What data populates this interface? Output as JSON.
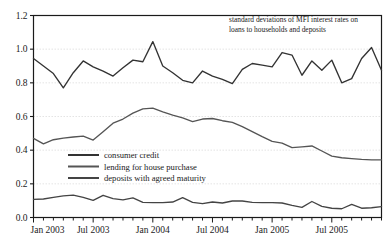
{
  "chart_data": {
    "type": "line",
    "title": "",
    "annotation_lines": [
      "standard deviations of MFI interest rates on",
      "loans to households and deposits"
    ],
    "xlabel": "",
    "ylabel": "",
    "ylim": [
      0.0,
      1.2
    ],
    "ytick_labels": [
      "0.0",
      "0.2",
      "0.4",
      "0.6",
      "0.8",
      "1.0",
      "1.2"
    ],
    "ytick_values": [
      0.0,
      0.2,
      0.4,
      0.6,
      0.8,
      1.0,
      1.2
    ],
    "xtick_labels": [
      "Jan 2003",
      "Jul 2003",
      "Jan 2004",
      "Jul 2004",
      "Jan 2005",
      "Jul 2005"
    ],
    "xtick_indices": [
      0,
      6,
      12,
      18,
      24,
      30
    ],
    "x_months": [
      "Jan 2003",
      "Feb 2003",
      "Mar 2003",
      "Apr 2003",
      "May 2003",
      "Jun 2003",
      "Jul 2003",
      "Aug 2003",
      "Sep 2003",
      "Oct 2003",
      "Nov 2003",
      "Dec 2003",
      "Jan 2004",
      "Feb 2004",
      "Mar 2004",
      "Apr 2004",
      "May 2004",
      "Jun 2004",
      "Jul 2004",
      "Aug 2004",
      "Sep 2004",
      "Oct 2004",
      "Nov 2004",
      "Dec 2004",
      "Jan 2005",
      "Feb 2005",
      "Mar 2005",
      "Apr 2005",
      "May 2005",
      "Jun 2005",
      "Jul 2005",
      "Aug 2005",
      "Sep 2005",
      "Oct 2005",
      "Nov 2005",
      "Dec 2005"
    ],
    "grid": true,
    "grid_axis": "y",
    "legend_position": "inside-left",
    "series": [
      {
        "name": "consumer credit",
        "color": "#333333",
        "values": [
          0.945,
          0.9,
          0.855,
          0.77,
          0.86,
          0.93,
          0.895,
          0.87,
          0.84,
          0.89,
          0.935,
          0.925,
          1.045,
          0.9,
          0.86,
          0.815,
          0.8,
          0.87,
          0.84,
          0.82,
          0.795,
          0.88,
          0.915,
          0.905,
          0.895,
          0.98,
          0.965,
          0.845,
          0.93,
          0.875,
          0.935,
          0.8,
          0.825,
          0.945,
          1.01,
          0.875
        ]
      },
      {
        "name": "lending for house purchase",
        "color": "#555555",
        "values": [
          0.47,
          0.437,
          0.462,
          0.472,
          0.478,
          0.483,
          0.46,
          0.51,
          0.56,
          0.585,
          0.62,
          0.645,
          0.65,
          0.628,
          0.608,
          0.592,
          0.57,
          0.585,
          0.588,
          0.575,
          0.565,
          0.54,
          0.51,
          0.48,
          0.452,
          0.442,
          0.415,
          0.42,
          0.425,
          0.395,
          0.365,
          0.355,
          0.35,
          0.345,
          0.342,
          0.342
        ]
      },
      {
        "name": "deposits with agreed maturity",
        "color": "#444444",
        "values": [
          0.108,
          0.11,
          0.12,
          0.128,
          0.133,
          0.12,
          0.102,
          0.132,
          0.112,
          0.105,
          0.117,
          0.09,
          0.088,
          0.088,
          0.092,
          0.118,
          0.09,
          0.082,
          0.092,
          0.086,
          0.098,
          0.098,
          0.09,
          0.088,
          0.088,
          0.086,
          0.072,
          0.06,
          0.095,
          0.066,
          0.055,
          0.052,
          0.078,
          0.055,
          0.058,
          0.065
        ]
      }
    ]
  },
  "axis_color": "#1a1a1a",
  "grid_color": "#d8d8d8",
  "background": "#ffffff"
}
